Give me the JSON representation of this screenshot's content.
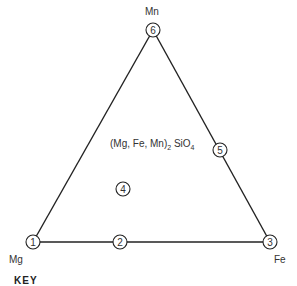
{
  "diagram": {
    "type": "ternary-composition-triangle",
    "vertices": {
      "top": "Mn",
      "bottom_left": "Mg",
      "bottom_right": "Fe"
    },
    "formula": {
      "prefix": "(Mg, Fe, Mn)",
      "sub1": "2",
      "mid": " SiO",
      "sub2": "4"
    },
    "points": [
      {
        "id": "1",
        "x": 33,
        "y": 242
      },
      {
        "id": "2",
        "x": 120,
        "y": 242
      },
      {
        "id": "3",
        "x": 270,
        "y": 242
      },
      {
        "id": "4",
        "x": 123,
        "y": 189
      },
      {
        "id": "5",
        "x": 220,
        "y": 150
      },
      {
        "id": "6",
        "x": 153,
        "y": 30
      }
    ],
    "key_label": "KEY",
    "line_color": "#222222"
  }
}
